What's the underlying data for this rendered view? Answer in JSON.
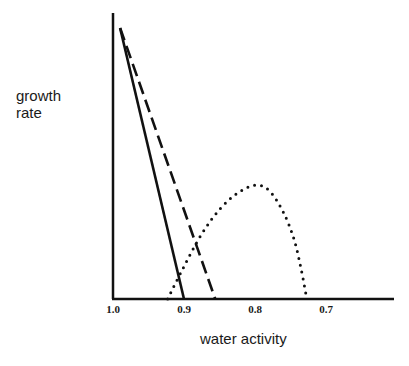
{
  "chart_data": {
    "type": "line",
    "title": "",
    "xlabel": "water activity",
    "ylabel": "growth rate",
    "x_reversed": true,
    "xlim": [
      1.0,
      0.6
    ],
    "ylim": [
      0,
      1.05
    ],
    "x_ticks": [
      "1.0",
      "0.9",
      "0.8",
      "0.7"
    ],
    "y_ticks": [],
    "grid": false,
    "legend": null,
    "series": [
      {
        "name": "solid",
        "style": "solid",
        "x": [
          0.99,
          0.9
        ],
        "y": [
          1.0,
          0.0
        ]
      },
      {
        "name": "dashed",
        "style": "dashed",
        "x": [
          0.99,
          0.856
        ],
        "y": [
          1.0,
          0.0
        ]
      },
      {
        "name": "dotted",
        "style": "dotted",
        "x": [
          0.923,
          0.9,
          0.875,
          0.85,
          0.825,
          0.8,
          0.78,
          0.76,
          0.745,
          0.735,
          0.727
        ],
        "y": [
          0.0,
          0.12,
          0.24,
          0.33,
          0.39,
          0.42,
          0.4,
          0.32,
          0.22,
          0.11,
          0.0
        ]
      }
    ]
  },
  "labels": {
    "ylabel_line1": "growth",
    "ylabel_line2": "rate",
    "xlabel": "water activity",
    "tick_1": "1.0",
    "tick_2": "0.9",
    "tick_3": "0.8",
    "tick_4": "0.7"
  }
}
